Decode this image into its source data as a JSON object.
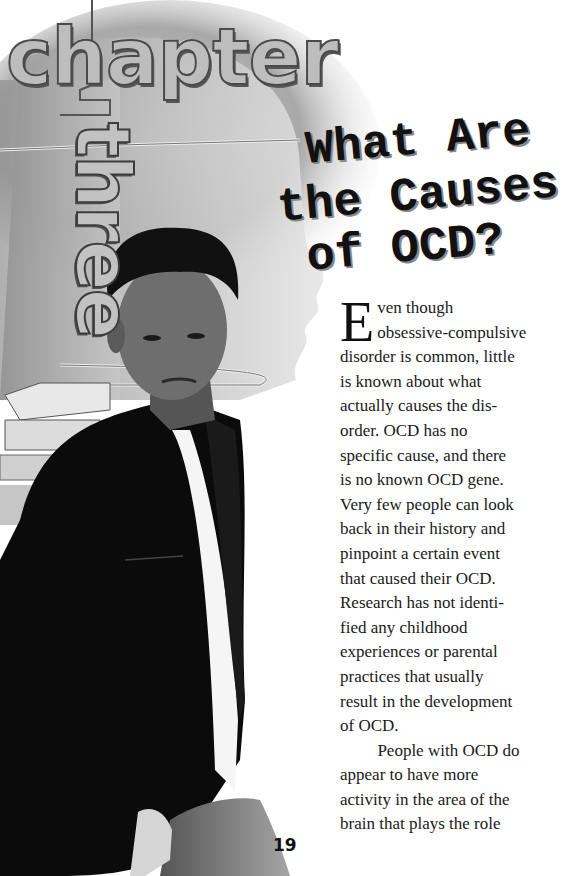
{
  "page": {
    "chapter_label": "chapter",
    "chapter_number_word": "three",
    "title_lines": [
      "What Are",
      "the Causes",
      "of OCD?"
    ],
    "page_number": "19"
  },
  "body": {
    "drop_cap": "E",
    "paragraphs": [
      {
        "lines": [
          "ven though",
          "obsessive-compulsive",
          "disorder is common, little",
          "is known about what",
          "actually causes the dis-",
          "order. OCD has no",
          "specific cause, and there",
          "is no known OCD gene.",
          "Very few people can look",
          "back in their history and",
          "pinpoint a certain event",
          "that caused their OCD.",
          "Research has not identi-",
          "fied any childhood",
          "experiences or parental",
          "practices that usually",
          "result in the development",
          "of OCD."
        ]
      },
      {
        "lines": [
          "People with OCD do",
          "appear to have more",
          "activity in the area of the",
          "brain that plays the role"
        ]
      }
    ]
  },
  "image": {
    "description": "Grayscale photo of a young man in a dark jacket and white shirt standing in front of a stack of books, over a stylized brain/head profile illustration",
    "colors": {
      "jacket": "#0a0a0a",
      "shirt": "#f4f4f4",
      "brain": "#b8b8b8"
    }
  }
}
